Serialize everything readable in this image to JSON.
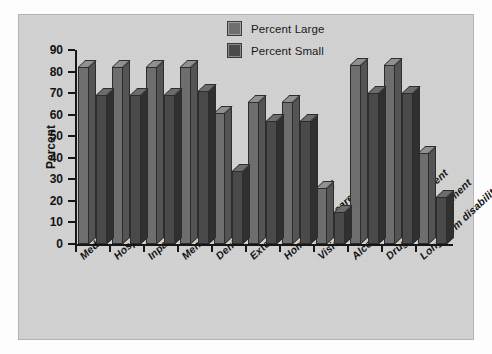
{
  "chart_data": {
    "type": "bar",
    "title": "",
    "xlabel": "",
    "ylabel": "Percent",
    "ylim": [
      0,
      90
    ],
    "yticks": [
      0,
      10,
      20,
      30,
      40,
      50,
      60,
      70,
      80,
      90
    ],
    "grid": false,
    "legend_position": "top-right",
    "style": "3d-grouped-bar",
    "categories": [
      "Medical",
      "Hospital room/board",
      "Inpatient surgery",
      "Mental health",
      "Dental",
      "Extended care facility",
      "Home health care",
      "Vision",
      "Alcohol abuse treatment",
      "Drug abuse treatment",
      "Long-term disability"
    ],
    "series": [
      {
        "name": "Percent Large",
        "color": "#6e6e6e",
        "values": [
          82,
          82,
          82,
          82,
          61,
          66,
          66,
          26,
          83,
          83,
          42
        ]
      },
      {
        "name": "Percent Small",
        "color": "#4a4a4a",
        "values": [
          69,
          69,
          69,
          71,
          34,
          57,
          57,
          15,
          70,
          70,
          22
        ]
      }
    ]
  },
  "legend": {
    "items": [
      {
        "label": "Percent Large",
        "color": "#6e6e6e"
      },
      {
        "label": "Percent Small",
        "color": "#4a4a4a"
      }
    ]
  },
  "axes": {
    "y": {
      "label": "Percent",
      "ticks": [
        "90",
        "80",
        "70",
        "60",
        "50",
        "40",
        "30",
        "20",
        "10",
        "0"
      ]
    }
  },
  "colors": {
    "panel_background": "#d2d2d2",
    "axis": "#141414",
    "series_large": "#6e6e6e",
    "series_small": "#4a4a4a",
    "bar_outline": "#2d2d2d"
  }
}
